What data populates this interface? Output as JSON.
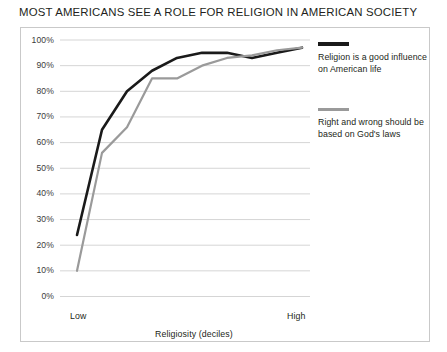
{
  "chart_data": {
    "type": "line",
    "title": "MOST AMERICANS SEE A ROLE FOR RELIGION IN AMERICAN SOCIETY",
    "xlabel": "Religiosity (deciles)",
    "ylabel": "",
    "x_axis_low_label": "Low",
    "x_axis_high_label": "High",
    "x": [
      1,
      2,
      3,
      4,
      5,
      6,
      7,
      8,
      9,
      10
    ],
    "ylim": [
      0,
      100
    ],
    "y_ticks": [
      0,
      10,
      20,
      30,
      40,
      50,
      60,
      70,
      80,
      90,
      100
    ],
    "y_tick_labels": [
      "0%",
      "10%",
      "20%",
      "30%",
      "40%",
      "50%",
      "60%",
      "70%",
      "80%",
      "90%",
      "100%"
    ],
    "grid": true,
    "legend_position": "right",
    "series": [
      {
        "name": "Religion is a good influence on American life",
        "color": "#1a1a1a",
        "values": [
          24,
          65,
          80,
          88,
          93,
          95,
          95,
          93,
          95,
          97
        ]
      },
      {
        "name": "Right and wrong should be based on God's laws",
        "color": "#9a9a9a",
        "values": [
          10,
          56,
          66,
          85,
          85,
          90,
          93,
          94,
          96,
          97
        ]
      }
    ]
  },
  "legend": {
    "entries": [
      {
        "label": "Religion is a good influence on American life"
      },
      {
        "label": "Right and wrong should be based on God's laws"
      }
    ]
  }
}
